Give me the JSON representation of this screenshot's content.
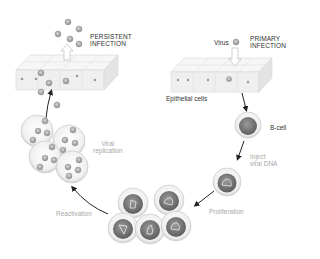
{
  "labels": {
    "persistent_infection": "PERSISTENT\nINFECTION",
    "primary_infection": "PRIMARY\nINFECTION",
    "virus": "Virus",
    "epithelial_cells": "Epithelial cells",
    "b_cell": "B-cell",
    "inject_viral_dna": "Inject\nviral DNA",
    "proliferation": "Proliferation",
    "reactivation": "Reactivation",
    "viral_replication": "Viral\nreplication"
  },
  "colors": {
    "epithelium": "#eeeeee",
    "epithelium_edge": "#cccccc",
    "virus": "#9a9a9a",
    "cell_membrane": "#dcdcdc",
    "nucleus": "#7a7a7a",
    "arrow": "#222222",
    "light_text": "#a8a8a8"
  }
}
